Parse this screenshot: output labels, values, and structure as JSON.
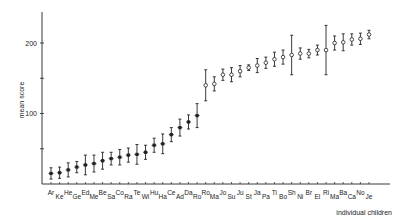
{
  "chart_data": {
    "type": "scatter",
    "title": "",
    "xlabel": "individual children",
    "ylabel": "mean score",
    "ylim": [
      0,
      240
    ],
    "yticks": [
      50,
      100,
      150,
      200
    ],
    "ytick_labels": [
      "",
      "100",
      "",
      "200"
    ],
    "grid": false,
    "legend": null,
    "error_bars": true,
    "categories": [
      "Ar",
      "Ke",
      "He",
      "Ge",
      "Ed",
      "Me",
      "Be",
      "Sa",
      "Co",
      "Ra",
      "Te",
      "Wi",
      "Hu",
      "Ha",
      "Ce",
      "Ad",
      "Da",
      "Ro",
      "Ro",
      "Ma",
      "Jo",
      "Su",
      "Ju",
      "St",
      "Ja",
      "Pa",
      "Ti",
      "Bo",
      "Sh",
      "Ni",
      "Br",
      "El",
      "Ri",
      "Ma",
      "Ba",
      "Ca",
      "No",
      "Je"
    ],
    "label_offset": [
      "up",
      "down",
      "up",
      "down",
      "up",
      "down",
      "up",
      "down",
      "up",
      "down",
      "up",
      "down",
      "up",
      "down",
      "up",
      "down",
      "up",
      "down",
      "up",
      "down",
      "up",
      "down",
      "up",
      "down",
      "up",
      "down",
      "up",
      "down",
      "up",
      "down",
      "up",
      "down",
      "up",
      "down",
      "up",
      "down",
      "up",
      "down"
    ],
    "values": [
      15,
      16,
      20,
      24,
      27,
      29,
      33,
      36,
      38,
      41,
      42,
      45,
      55,
      57,
      70,
      80,
      88,
      97,
      140,
      142,
      155,
      155,
      160,
      165,
      168,
      172,
      177,
      180,
      183,
      185,
      185,
      190,
      190,
      200,
      201,
      205,
      206,
      212
    ],
    "error_low": [
      8,
      8,
      10,
      8,
      14,
      12,
      12,
      9,
      11,
      10,
      14,
      10,
      10,
      14,
      10,
      12,
      10,
      17,
      22,
      10,
      8,
      10,
      8,
      4,
      10,
      8,
      10,
      10,
      28,
      8,
      6,
      7,
      35,
      10,
      12,
      8,
      8,
      6
    ],
    "error_high": [
      8,
      8,
      10,
      8,
      14,
      12,
      12,
      9,
      11,
      10,
      14,
      10,
      10,
      14,
      10,
      12,
      10,
      17,
      22,
      10,
      8,
      10,
      8,
      4,
      10,
      8,
      10,
      10,
      28,
      8,
      6,
      7,
      35,
      10,
      12,
      8,
      8,
      6
    ],
    "marker": [
      "filled",
      "filled",
      "filled",
      "filled",
      "filled",
      "filled",
      "filled",
      "filled",
      "filled",
      "filled",
      "filled",
      "filled",
      "filled",
      "filled",
      "filled",
      "filled",
      "filled",
      "filled",
      "open",
      "open",
      "open",
      "open",
      "open",
      "open",
      "open",
      "open",
      "open",
      "open",
      "open",
      "open",
      "open",
      "open",
      "open",
      "open",
      "open",
      "open",
      "open",
      "open"
    ]
  },
  "colors": {
    "ink": "#222222",
    "background": "#ffffff"
  }
}
